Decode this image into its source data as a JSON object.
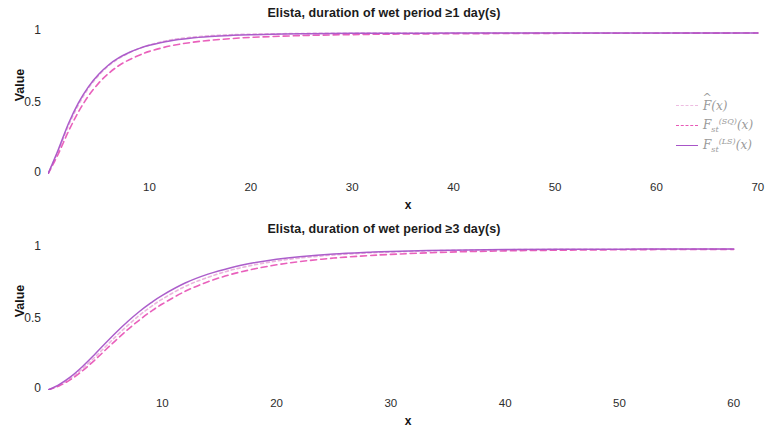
{
  "chart_data": [
    {
      "type": "line",
      "title": "Elista, duration of wet period ≥1 day(s)",
      "xlabel": "x",
      "ylabel": "Value",
      "xlim": [
        0,
        71
      ],
      "ylim": [
        0,
        1.05
      ],
      "xticks": [
        10,
        20,
        30,
        40,
        50,
        60,
        70
      ],
      "yticks": [
        0,
        0.5,
        1
      ],
      "ytick_labels": [
        "0",
        "0.5",
        "1"
      ],
      "grid": false,
      "legend_position": "right",
      "series": [
        {
          "name": "F_hat",
          "label": "F̂(x)",
          "color": "#e8a8d8",
          "style": "dashed",
          "x": [
            0,
            1,
            2,
            3,
            4,
            5,
            6,
            7,
            8,
            9,
            10,
            12,
            14,
            16,
            18,
            20,
            25,
            30,
            35,
            40,
            50,
            60,
            70
          ],
          "y": [
            0,
            0.16,
            0.34,
            0.49,
            0.61,
            0.7,
            0.77,
            0.82,
            0.86,
            0.89,
            0.915,
            0.95,
            0.969,
            0.981,
            0.988,
            0.992,
            0.997,
            0.999,
            0.9995,
            1.0,
            1.0,
            1.0,
            1.0
          ]
        },
        {
          "name": "F_st_SQ",
          "label": "F_st^(SQ)(x)",
          "color": "#e858b8",
          "style": "dashed",
          "x": [
            0,
            1,
            2,
            3,
            4,
            5,
            6,
            7,
            8,
            9,
            10,
            12,
            14,
            16,
            18,
            20,
            25,
            30,
            35,
            40,
            50,
            60,
            70
          ],
          "y": [
            0,
            0.14,
            0.3,
            0.44,
            0.555,
            0.645,
            0.715,
            0.77,
            0.81,
            0.843,
            0.87,
            0.908,
            0.932,
            0.949,
            0.96,
            0.969,
            0.982,
            0.989,
            0.993,
            0.995,
            0.998,
            0.999,
            1.0
          ]
        },
        {
          "name": "F_st_LS",
          "label": "F_st^(LS)(x)",
          "color": "#a855c8",
          "style": "solid",
          "x": [
            0,
            1,
            2,
            3,
            4,
            5,
            6,
            7,
            8,
            9,
            10,
            12,
            14,
            16,
            18,
            20,
            25,
            30,
            35,
            40,
            50,
            60,
            70
          ],
          "y": [
            0,
            0.17,
            0.355,
            0.505,
            0.62,
            0.707,
            0.775,
            0.825,
            0.862,
            0.891,
            0.913,
            0.944,
            0.963,
            0.975,
            0.983,
            0.988,
            0.995,
            0.998,
            0.999,
            0.9995,
            1.0,
            1.0,
            1.0
          ]
        }
      ]
    },
    {
      "type": "line",
      "title": "Elista, duration of wet period ≥3 day(s)",
      "xlabel": "x",
      "ylabel": "Value",
      "xlim": [
        0,
        63
      ],
      "ylim": [
        0,
        1.05
      ],
      "xticks": [
        10,
        20,
        30,
        40,
        50,
        60
      ],
      "yticks": [
        0,
        0.5,
        1
      ],
      "ytick_labels": [
        "0",
        "0.5",
        "1"
      ],
      "grid": false,
      "legend_position": "right",
      "series": [
        {
          "name": "F_hat",
          "label": "F̂(x)",
          "color": "#e8a8d8",
          "style": "dashed",
          "x": [
            0,
            1,
            2,
            3,
            4,
            5,
            6,
            7,
            8,
            9,
            10,
            12,
            14,
            16,
            18,
            20,
            22,
            25,
            28,
            30,
            35,
            40,
            45,
            50,
            55,
            60
          ],
          "y": [
            0,
            0.035,
            0.085,
            0.15,
            0.225,
            0.305,
            0.385,
            0.46,
            0.53,
            0.59,
            0.645,
            0.735,
            0.8,
            0.85,
            0.887,
            0.915,
            0.936,
            0.958,
            0.972,
            0.979,
            0.99,
            0.995,
            0.998,
            0.999,
            1.0,
            1.0
          ]
        },
        {
          "name": "F_st_SQ",
          "label": "F_st^(SQ)(x)",
          "color": "#e858b8",
          "style": "dashed",
          "x": [
            0,
            1,
            2,
            3,
            4,
            5,
            6,
            7,
            8,
            9,
            10,
            12,
            14,
            16,
            18,
            20,
            22,
            25,
            28,
            30,
            35,
            40,
            45,
            50,
            55,
            60
          ],
          "y": [
            0,
            0.03,
            0.075,
            0.135,
            0.205,
            0.282,
            0.358,
            0.43,
            0.497,
            0.557,
            0.61,
            0.7,
            0.768,
            0.82,
            0.858,
            0.888,
            0.911,
            0.936,
            0.953,
            0.962,
            0.978,
            0.987,
            0.992,
            0.995,
            0.997,
            0.998
          ]
        },
        {
          "name": "F_st_LS",
          "label": "F_st^(LS)(x)",
          "color": "#a855c8",
          "style": "solid",
          "x": [
            0,
            1,
            2,
            3,
            4,
            5,
            6,
            7,
            8,
            9,
            10,
            12,
            14,
            16,
            18,
            20,
            22,
            25,
            28,
            30,
            35,
            40,
            45,
            50,
            55,
            60
          ],
          "y": [
            0,
            0.04,
            0.095,
            0.165,
            0.245,
            0.33,
            0.412,
            0.488,
            0.557,
            0.618,
            0.672,
            0.759,
            0.822,
            0.868,
            0.902,
            0.928,
            0.946,
            0.965,
            0.977,
            0.983,
            0.992,
            0.996,
            0.998,
            0.999,
            1.0,
            1.0
          ]
        }
      ]
    }
  ],
  "charts": [
    {
      "title": "Elista, duration of wet period ≥1 day(s)",
      "ylabel": "Value",
      "xlabel": "x",
      "ytick_labels": [
        "1",
        "0.5",
        "0"
      ],
      "xtick_labels": [
        "10",
        "20",
        "30",
        "40",
        "50",
        "60",
        "70"
      ],
      "legend": [
        {
          "label_main": "F",
          "label_sub": "",
          "label_sup": "",
          "hat": true
        },
        {
          "label_main": "F",
          "label_sub": "st",
          "label_sup": "(SQ)",
          "hat": false
        },
        {
          "label_main": "F",
          "label_sub": "st",
          "label_sup": "(LS)",
          "hat": false
        }
      ]
    },
    {
      "title": "Elista, duration of wet period ≥3 day(s)",
      "ylabel": "Value",
      "xlabel": "x",
      "ytick_labels": [
        "1",
        "0.5",
        "0"
      ],
      "xtick_labels": [
        "10",
        "20",
        "30",
        "40",
        "50",
        "60"
      ],
      "legend": [
        {
          "label_main": "F",
          "label_sub": "",
          "label_sup": "",
          "hat": true
        },
        {
          "label_main": "F",
          "label_sub": "st",
          "label_sup": "(SQ)",
          "hat": false
        },
        {
          "label_main": "F",
          "label_sub": "st",
          "label_sup": "(LS)",
          "hat": false
        }
      ]
    }
  ]
}
